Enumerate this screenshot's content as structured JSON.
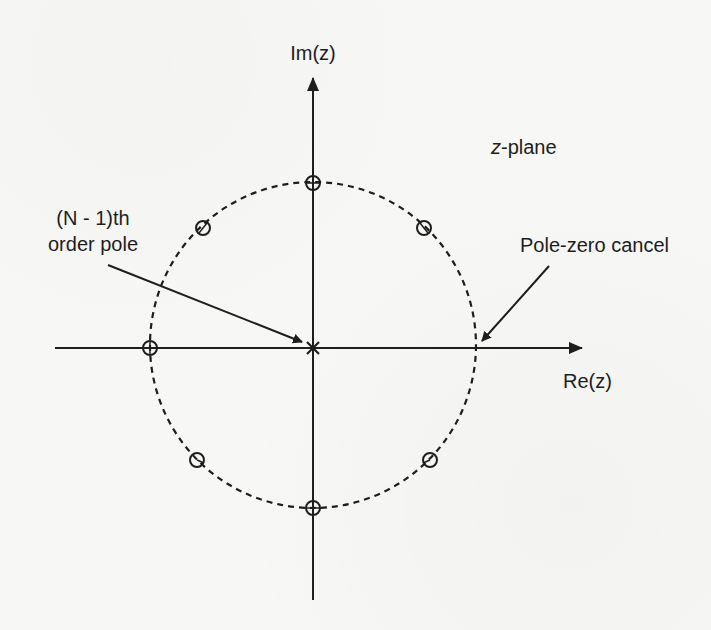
{
  "figure": {
    "plane_label_prefix": "z",
    "plane_label_suffix": "-plane",
    "axes": {
      "imag_label": "Im(z)",
      "real_label": "Re(z)"
    },
    "annotations": {
      "pole_label_line1": "(N - 1)th",
      "pole_label_line2": "order pole",
      "cancel_label": "Pole-zero cancel"
    },
    "colors": {
      "ink": "#1e1e1e",
      "background": "#f7f7f5"
    },
    "unit_circle": {
      "center": [
        313,
        345
      ],
      "radius": 163,
      "style": "dashed"
    },
    "zeros": [
      {
        "name": "zero-top",
        "angle_deg": 90
      },
      {
        "name": "zero-upper-right",
        "angle_deg": 45
      },
      {
        "name": "zero-upper-left",
        "angle_deg": 135
      },
      {
        "name": "zero-left",
        "angle_deg": 180
      },
      {
        "name": "zero-lower-left",
        "angle_deg": 225
      },
      {
        "name": "zero-bottom",
        "angle_deg": 270
      },
      {
        "name": "zero-lower-right",
        "angle_deg": 315
      }
    ],
    "cancelled_point": {
      "angle_deg": 0
    },
    "pole": {
      "location": "origin",
      "symbol": "x"
    }
  }
}
